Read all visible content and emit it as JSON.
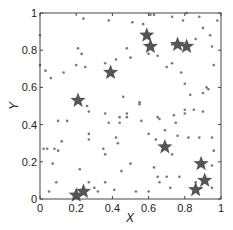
{
  "chart_data": {
    "type": "scatter",
    "title": "",
    "xlabel": "X",
    "ylabel": "Y",
    "xlim": [
      0,
      1
    ],
    "ylim": [
      0,
      1
    ],
    "grid": false,
    "legend": null,
    "x_ticks": [
      "0",
      "0.2",
      "0.4",
      "0.6",
      "0.8",
      "1"
    ],
    "y_ticks": [
      "0",
      "0.2",
      "0.4",
      "0.6",
      "0.8",
      "1"
    ],
    "series": [
      {
        "name": "points",
        "marker": "dot",
        "color": "#777777",
        "points": [
          [
            0.24,
            0.97
          ],
          [
            0.38,
            0.96
          ],
          [
            0.61,
            0.99
          ],
          [
            0.63,
            0.99
          ],
          [
            0.81,
            1.0
          ],
          [
            0.88,
            0.98
          ],
          [
            0.73,
            0.98
          ],
          [
            0.79,
            0.96
          ],
          [
            0.98,
            0.96
          ],
          [
            0.51,
            0.95
          ],
          [
            0.57,
            0.94
          ],
          [
            0.9,
            0.92
          ],
          [
            0.94,
            0.88
          ],
          [
            0.86,
            0.86
          ],
          [
            0.95,
            0.82
          ],
          [
            0.0,
            0.88
          ],
          [
            0.21,
            0.81
          ],
          [
            0.23,
            0.78
          ],
          [
            0.2,
            0.72
          ],
          [
            0.25,
            0.71
          ],
          [
            0.0,
            0.72
          ],
          [
            0.03,
            0.69
          ],
          [
            0.06,
            0.65
          ],
          [
            0.13,
            0.68
          ],
          [
            0.36,
            0.73
          ],
          [
            0.42,
            0.75
          ],
          [
            0.48,
            0.81
          ],
          [
            0.5,
            0.76
          ],
          [
            0.6,
            0.78
          ],
          [
            0.65,
            0.77
          ],
          [
            0.73,
            0.83
          ],
          [
            0.73,
            0.73
          ],
          [
            0.7,
            0.71
          ],
          [
            0.78,
            0.68
          ],
          [
            0.8,
            0.62
          ],
          [
            0.83,
            0.56
          ],
          [
            0.9,
            0.57
          ],
          [
            0.92,
            0.6
          ],
          [
            0.93,
            0.59
          ],
          [
            0.96,
            0.72
          ],
          [
            0.55,
            0.52
          ],
          [
            0.55,
            0.51
          ],
          [
            0.56,
            0.42
          ],
          [
            0.46,
            0.55
          ],
          [
            0.36,
            0.46
          ],
          [
            0.27,
            0.47
          ],
          [
            0.26,
            0.5
          ],
          [
            0.44,
            0.41
          ],
          [
            0.48,
            0.46
          ],
          [
            0.43,
            0.3
          ],
          [
            0.35,
            0.27
          ],
          [
            0.36,
            0.24
          ],
          [
            0.48,
            0.44
          ],
          [
            0.6,
            0.35
          ],
          [
            0.64,
            0.32
          ],
          [
            0.65,
            0.44
          ],
          [
            0.66,
            0.43
          ],
          [
            0.69,
            0.37
          ],
          [
            0.74,
            0.45
          ],
          [
            0.8,
            0.48
          ],
          [
            0.85,
            0.48
          ],
          [
            0.8,
            0.46
          ],
          [
            0.9,
            0.47
          ],
          [
            0.75,
            0.41
          ],
          [
            0.76,
            0.34
          ],
          [
            0.82,
            0.33
          ],
          [
            0.88,
            0.33
          ],
          [
            0.95,
            0.33
          ],
          [
            0.96,
            0.26
          ],
          [
            0.73,
            0.24
          ],
          [
            0.9,
            0.19
          ],
          [
            0.95,
            0.18
          ],
          [
            0.65,
            0.12
          ],
          [
            0.7,
            0.12
          ],
          [
            0.77,
            0.12
          ],
          [
            0.66,
            0.09
          ],
          [
            0.72,
            0.06
          ],
          [
            0.86,
            0.09
          ],
          [
            0.89,
            0.06
          ],
          [
            0.95,
            0.06
          ],
          [
            0.02,
            0.27
          ],
          [
            0.04,
            0.27
          ],
          [
            0.08,
            0.27
          ],
          [
            0.1,
            0.26
          ],
          [
            0.12,
            0.31
          ],
          [
            0.1,
            0.42
          ],
          [
            0.15,
            0.42
          ],
          [
            0.07,
            0.19
          ],
          [
            0.09,
            0.09
          ],
          [
            0.05,
            0.04
          ],
          [
            0.22,
            0.16
          ],
          [
            0.27,
            0.09
          ],
          [
            0.3,
            0.06
          ],
          [
            0.32,
            0.04
          ],
          [
            0.41,
            0.05
          ],
          [
            0.53,
            0.04
          ],
          [
            0.6,
            0.04
          ],
          [
            0.42,
            0.33
          ],
          [
            0.38,
            0.41
          ],
          [
            0.44,
            0.44
          ],
          [
            0.27,
            0.35
          ],
          [
            0.27,
            0.32
          ],
          [
            0.36,
            0.09
          ],
          [
            0.45,
            0.15
          ],
          [
            0.5,
            0.19
          ],
          [
            0.63,
            0.17
          ]
        ]
      },
      {
        "name": "stars",
        "marker": "star",
        "color": "#555555",
        "points": [
          [
            0.2,
            0.02
          ],
          [
            0.24,
            0.04
          ],
          [
            0.21,
            0.53
          ],
          [
            0.39,
            0.68
          ],
          [
            0.59,
            0.88
          ],
          [
            0.61,
            0.82
          ],
          [
            0.76,
            0.83
          ],
          [
            0.81,
            0.82
          ],
          [
            0.69,
            0.28
          ],
          [
            0.89,
            0.19
          ],
          [
            0.91,
            0.1
          ],
          [
            0.86,
            0.05
          ]
        ]
      }
    ]
  }
}
